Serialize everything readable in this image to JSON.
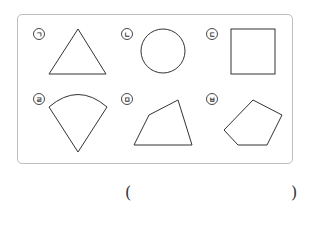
{
  "figure": {
    "items": [
      {
        "label": "ㄱ",
        "shape": "triangle",
        "label_x": 39,
        "label_y": 34
      },
      {
        "label": "ㄴ",
        "shape": "circle",
        "label_x": 127,
        "label_y": 34
      },
      {
        "label": "ㄷ",
        "shape": "square",
        "label_x": 212,
        "label_y": 34
      },
      {
        "label": "ㄹ",
        "shape": "sector",
        "label_x": 39,
        "label_y": 99
      },
      {
        "label": "ㅁ",
        "shape": "quadrilateral",
        "label_x": 127,
        "label_y": 99
      },
      {
        "label": "ㅂ",
        "shape": "pentagon",
        "label_x": 212,
        "label_y": 99
      }
    ],
    "stroke_color": "#333333",
    "frame_color": "#bdbdbd"
  },
  "answer": {
    "open_paren": "(",
    "close_paren": ")",
    "value": ""
  }
}
